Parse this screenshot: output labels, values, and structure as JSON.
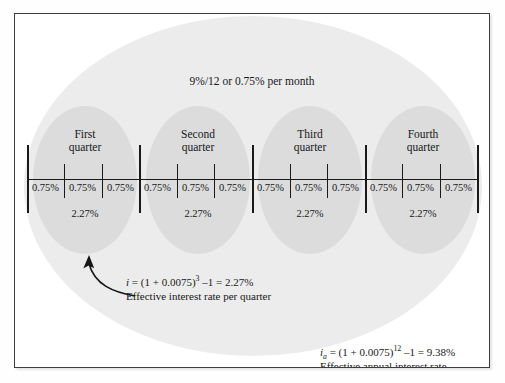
{
  "figure": {
    "nominal_note": "9%/12 or 0.75% per month",
    "axis": {
      "num_quarters": 4,
      "months_per_quarter": 3,
      "total_months": 12
    },
    "quarters": [
      {
        "name_line1": "First",
        "name_line2": "quarter",
        "effective_rate": "2.27%",
        "months": [
          "0.75%",
          "0.75%",
          "0.75%"
        ]
      },
      {
        "name_line1": "Second",
        "name_line2": "quarter",
        "effective_rate": "2.27%",
        "months": [
          "0.75%",
          "0.75%",
          "0.75%"
        ]
      },
      {
        "name_line1": "Third",
        "name_line2": "quarter",
        "effective_rate": "2.27%",
        "months": [
          "0.75%",
          "0.75%",
          "0.75%"
        ]
      },
      {
        "name_line1": "Fourth",
        "name_line2": "quarter",
        "effective_rate": "2.27%",
        "months": [
          "0.75%",
          "0.75%",
          "0.75%"
        ]
      }
    ],
    "quarter_annotation": {
      "symbol": "i",
      "subscript": "",
      "formula_head": " = (1 + 0.0075)",
      "exponent": "3",
      "formula_tail": " –1 = 2.27%",
      "caption": "Effective interest rate per quarter"
    },
    "annual_annotation": {
      "symbol": "i",
      "subscript": "a",
      "formula_head": " = (1 + 0.0075)",
      "exponent": "12",
      "formula_tail": " –1 = 9.38%",
      "caption": "Effective annual interest rate"
    },
    "colors": {
      "outer_ellipse": "#ececec",
      "quarter_ellipse": "#dcdcdc",
      "line": "#1a1a1a",
      "text": "#16181a",
      "frame_border": "#3d3d3d",
      "page_background": "#ffffff"
    }
  }
}
